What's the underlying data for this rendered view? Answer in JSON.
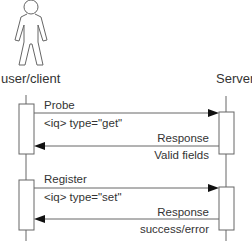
{
  "actors": {
    "client": {
      "label": "user/client"
    },
    "server": {
      "label": "Server"
    }
  },
  "messages": [
    {
      "id": "probe",
      "label": "Probe",
      "detail": "<iq> type=\"get\"",
      "direction": "client-to-server"
    },
    {
      "id": "probe-response",
      "label": "Response",
      "detail": "Valid fields",
      "direction": "server-to-client"
    },
    {
      "id": "register",
      "label": "Register",
      "detail": "<iq> type=\"set\"",
      "direction": "client-to-server"
    },
    {
      "id": "register-response",
      "label": "Response",
      "detail": "success/error",
      "direction": "server-to-client"
    }
  ],
  "colors": {
    "stroke": "#555555",
    "text": "#333333",
    "background": "#ffffff"
  }
}
